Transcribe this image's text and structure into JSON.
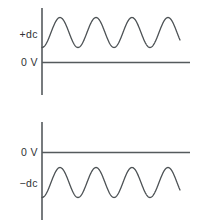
{
  "figure": {
    "background_color": "#ffffff",
    "axis_color": "#555a5d",
    "wave_color": "#4d5255",
    "label_color": "#2f3234"
  },
  "charts": [
    {
      "id": "positive-dc-chart",
      "name": "positive-dc-offset-waveform",
      "labels": {
        "offset": "+dc",
        "zero": "0 V"
      },
      "description": "Sine wave riding entirely above the 0 V axis on a positive dc level"
    },
    {
      "id": "negative-dc-chart",
      "name": "negative-dc-offset-waveform",
      "labels": {
        "zero": "0 V",
        "offset": "−dc"
      },
      "description": "Sine wave riding entirely below the 0 V axis on a negative dc level"
    }
  ],
  "chart_data": [
    {
      "type": "line",
      "id": "positive-dc-chart",
      "title": "",
      "xlabel": "",
      "ylabel": "",
      "grid": false,
      "legend": null,
      "xlim": [
        0,
        148
      ],
      "ylim": [
        -30,
        58
      ],
      "annotations": [
        {
          "text": "+dc",
          "value": 30,
          "axis": "y",
          "position": "left"
        },
        {
          "text": "0 V",
          "value": 0,
          "axis": "y",
          "position": "left"
        }
      ],
      "series": [
        {
          "name": "sine-on-positive-dc",
          "waveform": "sine",
          "dc_offset": 30,
          "amplitude": 15,
          "cycles": 3.75,
          "period_px": 36,
          "phase_deg": 270,
          "x_start": 0,
          "x_end": 138,
          "values_note": "y = 30 + 15*sin(2*pi*(x)/36 - 90deg)"
        }
      ],
      "axes": {
        "vertical_axis_x": 0,
        "vertical_axis_y_range": [
          -27,
          54
        ],
        "horizontal_axis_y": 0,
        "horizontal_axis_x_range": [
          0,
          148
        ]
      }
    },
    {
      "type": "line",
      "id": "negative-dc-chart",
      "title": "",
      "xlabel": "",
      "ylabel": "",
      "grid": false,
      "legend": null,
      "xlim": [
        0,
        148
      ],
      "ylim": [
        -68,
        30
      ],
      "annotations": [
        {
          "text": "0 V",
          "value": 0,
          "axis": "y",
          "position": "left"
        },
        {
          "text": "−dc",
          "value": -30,
          "axis": "y",
          "position": "left"
        }
      ],
      "series": [
        {
          "name": "sine-on-negative-dc",
          "waveform": "sine",
          "dc_offset": -30,
          "amplitude": 15,
          "cycles": 3.75,
          "period_px": 36,
          "phase_deg": 270,
          "x_start": 0,
          "x_end": 138,
          "values_note": "y = -30 + 15*sin(2*pi*(x)/36 - 90deg)"
        }
      ],
      "axes": {
        "vertical_axis_x": 0,
        "vertical_axis_y_range": [
          30,
          -68
        ],
        "horizontal_axis_y": 0,
        "horizontal_axis_x_range": [
          0,
          148
        ]
      }
    }
  ]
}
